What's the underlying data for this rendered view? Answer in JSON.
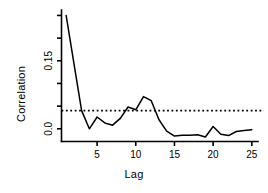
{
  "chart_data": {
    "type": "line",
    "title": "",
    "subtitle": "",
    "xlabel": "Lag",
    "ylabel": "Correlation",
    "x": [
      1,
      2,
      3,
      4,
      5,
      6,
      7,
      8,
      9,
      10,
      11,
      12,
      13,
      14,
      15,
      16,
      17,
      18,
      19,
      20,
      21,
      22,
      23,
      24,
      25
    ],
    "values": [
      0.25,
      0.145,
      0.04,
      0.0,
      0.026,
      0.013,
      0.008,
      0.023,
      0.048,
      0.042,
      0.071,
      0.062,
      0.02,
      -0.005,
      -0.016,
      -0.014,
      -0.014,
      -0.013,
      -0.018,
      0.005,
      -0.012,
      -0.015,
      -0.006,
      -0.004,
      -0.002
    ],
    "series": [
      {
        "name": "Correlation",
        "values": [
          0.25,
          0.145,
          0.04,
          0.0,
          0.026,
          0.013,
          0.008,
          0.023,
          0.048,
          0.042,
          0.071,
          0.062,
          0.02,
          -0.005,
          -0.016,
          -0.014,
          -0.014,
          -0.013,
          -0.018,
          0.005,
          -0.012,
          -0.015,
          -0.006,
          -0.004,
          -0.002
        ],
        "color": "#000000",
        "style": "solid"
      }
    ],
    "reference_lines": [
      {
        "name": "significance-threshold",
        "orientation": "horizontal",
        "value": 0.04,
        "style": "dotted",
        "color": "#000000"
      }
    ],
    "xlim": [
      0.4,
      25.8
    ],
    "ylim": [
      -0.028,
      0.262
    ],
    "xticks": [
      5,
      10,
      15,
      20,
      25
    ],
    "xticklabels": [
      "5",
      "10",
      "15",
      "20",
      "25"
    ],
    "yticks": [
      0.0,
      0.05,
      0.1,
      0.15,
      0.2,
      0.25
    ],
    "yticklabels": [
      "0.0",
      "",
      "",
      "0.15",
      "",
      ""
    ],
    "ytick_labeled": [
      {
        "value": 0.0,
        "label": "0.0"
      },
      {
        "value": 0.15,
        "label": "0.15"
      }
    ],
    "grid": false,
    "legend": false,
    "legend_position": "none",
    "background": "#ffffff",
    "axis_color": "#000000"
  }
}
